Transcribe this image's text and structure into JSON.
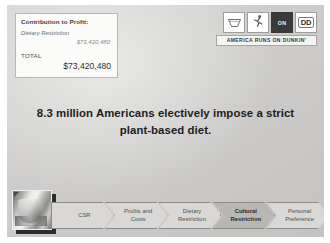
{
  "slide": {
    "contribution_box": {
      "title": "Contribution to Profit:",
      "rows": [
        {
          "label": "Dietary Restriction",
          "value": "$73,420,480"
        }
      ],
      "total_label": "TOTAL",
      "total_value": "$73,420,480"
    },
    "brand": {
      "tagline": "AMERICA RUNS ON DUNKIN'",
      "tiles": [
        {
          "name": "coffee-cup-icon",
          "text": ""
        },
        {
          "name": "runner-icon",
          "text": ""
        },
        {
          "name": "on-badge-icon",
          "text": "ON"
        },
        {
          "name": "dd-logo-icon",
          "text": "DD"
        }
      ]
    },
    "headline": "8.3 million Americans electively impose a strict plant-based diet.",
    "nav": {
      "items": [
        {
          "label": "CSR",
          "active": false
        },
        {
          "label": "Profits and\nCosts",
          "active": false
        },
        {
          "label": "Dietary\nRestriction",
          "active": false
        },
        {
          "label": "Cultural\nRestriction",
          "active": true
        },
        {
          "label": "Personal\nPreference",
          "active": false
        }
      ]
    },
    "thumbnail": {
      "name": "coffee-photo-thumbnail"
    },
    "colors": {
      "background": "#cfcecc",
      "box_background": "#fbfbfa",
      "chevron": "#d9d8d6",
      "chevron_active": "#b8b7b4",
      "text_dark": "#1d1d1c"
    }
  }
}
